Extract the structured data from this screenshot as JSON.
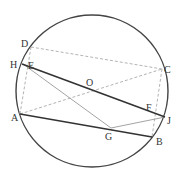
{
  "diagram": {
    "circle": {
      "center": "O",
      "cx": 92,
      "cy": 91,
      "r": 76,
      "color": "#444444"
    },
    "points": [
      {
        "label": "D",
        "x": 31,
        "y": 47,
        "lx": 21,
        "ly": 47
      },
      {
        "label": "H",
        "x": 22,
        "y": 64,
        "lx": 10,
        "ly": 68
      },
      {
        "label": "E",
        "x": 23,
        "y": 64,
        "lx": 28,
        "ly": 69
      },
      {
        "label": "A",
        "x": 20,
        "y": 114,
        "lx": 11,
        "ly": 121
      },
      {
        "label": "C",
        "x": 162,
        "y": 69,
        "lx": 164,
        "ly": 73
      },
      {
        "label": "O",
        "x": 91,
        "y": 87,
        "lx": 86,
        "ly": 86
      },
      {
        "label": "F",
        "x": 156,
        "y": 114,
        "lx": 146,
        "ly": 111
      },
      {
        "label": "J",
        "x": 165,
        "y": 117,
        "lx": 167,
        "ly": 124
      },
      {
        "label": "G",
        "x": 111,
        "y": 128,
        "lx": 105,
        "ly": 140
      },
      {
        "label": "B",
        "x": 152,
        "y": 137,
        "lx": 156,
        "ly": 145
      }
    ],
    "solid_lines": [
      {
        "from": "H",
        "to": "J",
        "x1": 22,
        "y1": 64,
        "x2": 165,
        "y2": 117,
        "color": "#333333",
        "width": 1.6
      },
      {
        "from": "A",
        "to": "B",
        "x1": 20,
        "y1": 114,
        "x2": 152,
        "y2": 137,
        "color": "#333333",
        "width": 1.6
      }
    ],
    "thin_lines": [
      {
        "from": "E",
        "to": "G",
        "x1": 23,
        "y1": 64,
        "x2": 111,
        "y2": 128,
        "color": "#999999",
        "width": 0.9
      },
      {
        "from": "G",
        "to": "J",
        "x1": 111,
        "y1": 128,
        "x2": 165,
        "y2": 117,
        "color": "#999999",
        "width": 0.9
      }
    ],
    "dashed_lines": [
      {
        "from": "D",
        "to": "C",
        "x1": 31,
        "y1": 47,
        "x2": 162,
        "y2": 69
      },
      {
        "from": "A",
        "to": "C",
        "x1": 20,
        "y1": 114,
        "x2": 162,
        "y2": 69
      },
      {
        "from": "D",
        "to": "A",
        "x1": 31,
        "y1": 47,
        "x2": 20,
        "y2": 114
      },
      {
        "from": "C",
        "to": "B",
        "x1": 162,
        "y1": 69,
        "x2": 152,
        "y2": 137
      }
    ],
    "dashed_color": "#aaaaaa"
  }
}
